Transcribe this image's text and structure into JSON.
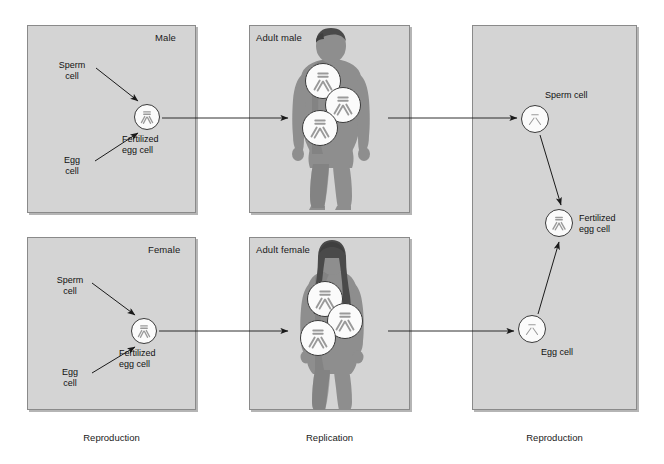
{
  "diagram": {
    "colors": {
      "panel_fill": "#d4d4d4",
      "panel_border": "#8a8a8a",
      "body_fill": "#8e8e8e",
      "body_shade": "#7a7a7a",
      "hair_fill": "#4a4a4a",
      "cell_fill": "#fbfbfb",
      "cell_border": "#3a3a3a",
      "chromosome": "#9a9a9a",
      "arrow": "#1a1a1a",
      "text": "#111111"
    }
  },
  "captions": [
    {
      "label": "Reproduction"
    },
    {
      "label": "Replication"
    },
    {
      "label": "Reproduction"
    }
  ],
  "panels": {
    "male_repro": {
      "title": "Male",
      "labels": {
        "sperm": "Sperm\ncell",
        "egg": "Egg\ncell",
        "fertilized": "Fertilized\negg cell"
      }
    },
    "female_repro": {
      "title": "Female",
      "labels": {
        "sperm": "Sperm\ncell",
        "egg": "Egg\ncell",
        "fertilized": "Fertilized\negg cell"
      }
    },
    "adult_male": {
      "title": "Adult male",
      "cell_count": 3,
      "cell_type": "diploid"
    },
    "adult_female": {
      "title": "Adult female",
      "cell_count": 3,
      "cell_type": "diploid"
    },
    "offspring_repro": {
      "labels": {
        "sperm": "Sperm cell",
        "egg": "Egg cell",
        "fertilized": "Fertilized\negg cell"
      }
    }
  },
  "text": {
    "sperm_cell_1": "Sperm",
    "sperm_cell_2": "cell",
    "egg_cell_1": "Egg",
    "egg_cell_2": "cell",
    "fertilized_1": "Fertilized",
    "fertilized_2": "egg cell",
    "sperm_cell_inline": "Sperm cell",
    "egg_cell_inline": "Egg cell",
    "male": "Male",
    "female": "Female",
    "adult_male": "Adult male",
    "adult_female": "Adult female",
    "reproduction": "Reproduction",
    "replication": "Replication"
  }
}
